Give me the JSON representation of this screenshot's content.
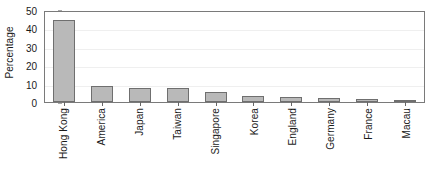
{
  "chart_data": {
    "type": "bar",
    "title": "",
    "xlabel": "",
    "ylabel": "Percentage",
    "ylim": [
      0,
      50
    ],
    "yticks": [
      0,
      10,
      20,
      30,
      40,
      50
    ],
    "grid": false,
    "legend": "none",
    "categories": [
      "Hong Kong",
      "America",
      "Japan",
      "Taiwan",
      "Singapore",
      "Korea",
      "England",
      "Germany",
      "France",
      "Macau"
    ],
    "values": [
      44.8,
      8.5,
      7.7,
      7.6,
      5.2,
      3.5,
      2.6,
      2.0,
      1.4,
      1.3
    ],
    "colors": {
      "bar_fill": "#b9b9b9",
      "bar_edge": "#6f6f6f",
      "axis": "#7a7a7a",
      "text": "#1a1a1a",
      "background": "#ffffff"
    }
  }
}
